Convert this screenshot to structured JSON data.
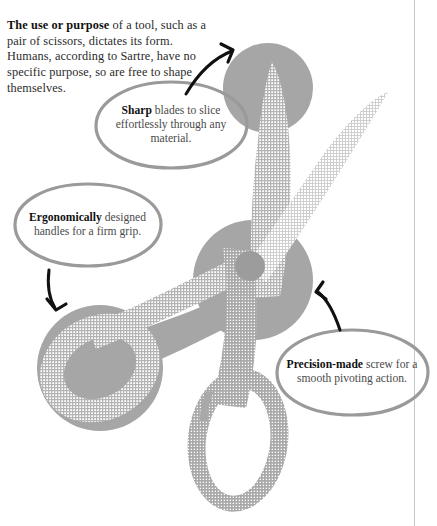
{
  "page": {
    "title": "The use or purpose of a tool",
    "background_color": "#ffffff",
    "rule_color": "#c9c9c9"
  },
  "intro": {
    "lead": "The use or purpose",
    "body": " of a tool, such as a pair of scissors, dictates its form. Humans, according to Sartre, have no specific purpose, so are free to shape themselves."
  },
  "callouts": [
    {
      "id": "sharp",
      "lead": "Sharp",
      "body": " blades to slice effortlessly through any material.",
      "arrow": "curved-arrow-up-right"
    },
    {
      "id": "ergonomically",
      "lead": "Ergonomically",
      "body": " designed handles for a firm grip.",
      "arrow": "curved-arrow-down"
    },
    {
      "id": "precision",
      "lead": "Precision-made",
      "body": " screw for a smooth pivoting action.",
      "arrow": "curved-arrow-up-left"
    }
  ],
  "illustration": {
    "subject": "pair-of-scissors",
    "parts": [
      "upper-blade",
      "lower-blade",
      "pivot-screw",
      "left-handle-ring",
      "bottom-handle-ring"
    ],
    "colors": {
      "solid_gray": "#a6a6a6",
      "halftone_gray": "#b6b6b6",
      "halftone_light": "#d8d8d8",
      "screw_gray": "#9c9c9c",
      "bubble_outline": "#9a9a9a",
      "arrow": "#111111"
    }
  }
}
